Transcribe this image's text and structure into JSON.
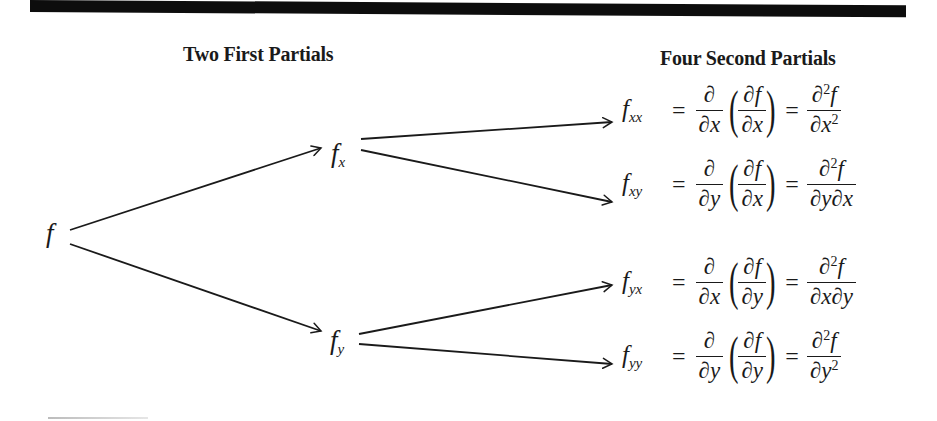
{
  "headings": {
    "first": "Two First Partials",
    "second": "Four Second Partials"
  },
  "nodes": {
    "root": {
      "base": "f",
      "sub": ""
    },
    "fx": {
      "base": "f",
      "sub": "x"
    },
    "fy": {
      "base": "f",
      "sub": "y"
    }
  },
  "formulas": [
    {
      "lhs_base": "f",
      "lhs_sub": "xx",
      "eq": "=",
      "outer_num": "∂",
      "outer_den": "∂x",
      "inner_num": "∂f",
      "inner_den": "∂x",
      "lparen": "(",
      "rparen": ")",
      "eq2": "=",
      "result_num_a": "∂",
      "result_num_sup": "2",
      "result_num_b": "f",
      "result_den_a": "∂x",
      "result_den_sup": "2"
    },
    {
      "lhs_base": "f",
      "lhs_sub": "xy",
      "eq": "=",
      "outer_num": "∂",
      "outer_den": "∂y",
      "inner_num": "∂f",
      "inner_den": "∂x",
      "lparen": "(",
      "rparen": ")",
      "eq2": "=",
      "result_num_a": "∂",
      "result_num_sup": "2",
      "result_num_b": "f",
      "result_den_a": "∂y∂x",
      "result_den_sup": ""
    },
    {
      "lhs_base": "f",
      "lhs_sub": "yx",
      "eq": "=",
      "outer_num": "∂",
      "outer_den": "∂x",
      "inner_num": "∂f",
      "inner_den": "∂y",
      "lparen": "(",
      "rparen": ")",
      "eq2": "=",
      "result_num_a": "∂",
      "result_num_sup": "2",
      "result_num_b": "f",
      "result_den_a": "∂x∂y",
      "result_den_sup": ""
    },
    {
      "lhs_base": "f",
      "lhs_sub": "yy",
      "eq": "=",
      "outer_num": "∂",
      "outer_den": "∂y",
      "inner_num": "∂f",
      "inner_den": "∂y",
      "lparen": "(",
      "rparen": ")",
      "eq2": "=",
      "result_num_a": "∂",
      "result_num_sup": "2",
      "result_num_b": "f",
      "result_den_a": "∂y",
      "result_den_sup": "2"
    }
  ],
  "edges": [
    {
      "from": "f",
      "to": "f_x"
    },
    {
      "from": "f",
      "to": "f_y"
    },
    {
      "from": "f_x",
      "to": "f_xx"
    },
    {
      "from": "f_x",
      "to": "f_xy"
    },
    {
      "from": "f_y",
      "to": "f_yx"
    },
    {
      "from": "f_y",
      "to": "f_yy"
    }
  ],
  "colors": {
    "ink": "#1a1a1a",
    "rule": "#0d0d0d",
    "background": "#ffffff"
  }
}
